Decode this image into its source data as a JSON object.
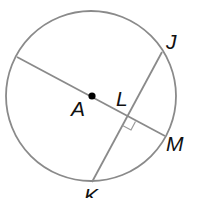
{
  "figure": {
    "type": "circle-geometry",
    "colors": {
      "stroke": "#8a8a8a",
      "point": "#000000",
      "label": "#111111",
      "background": "#ffffff"
    },
    "circle": {
      "center": "A"
    },
    "segments": [
      {
        "name": "diameter-through-A",
        "from": "left-edge",
        "to": "M"
      },
      {
        "name": "chord-JK",
        "from": "J",
        "to": "K"
      }
    ],
    "right_angle_at": "L",
    "labels": {
      "A": "A",
      "L": "L",
      "J": "J",
      "M": "M",
      "K": "K"
    }
  }
}
